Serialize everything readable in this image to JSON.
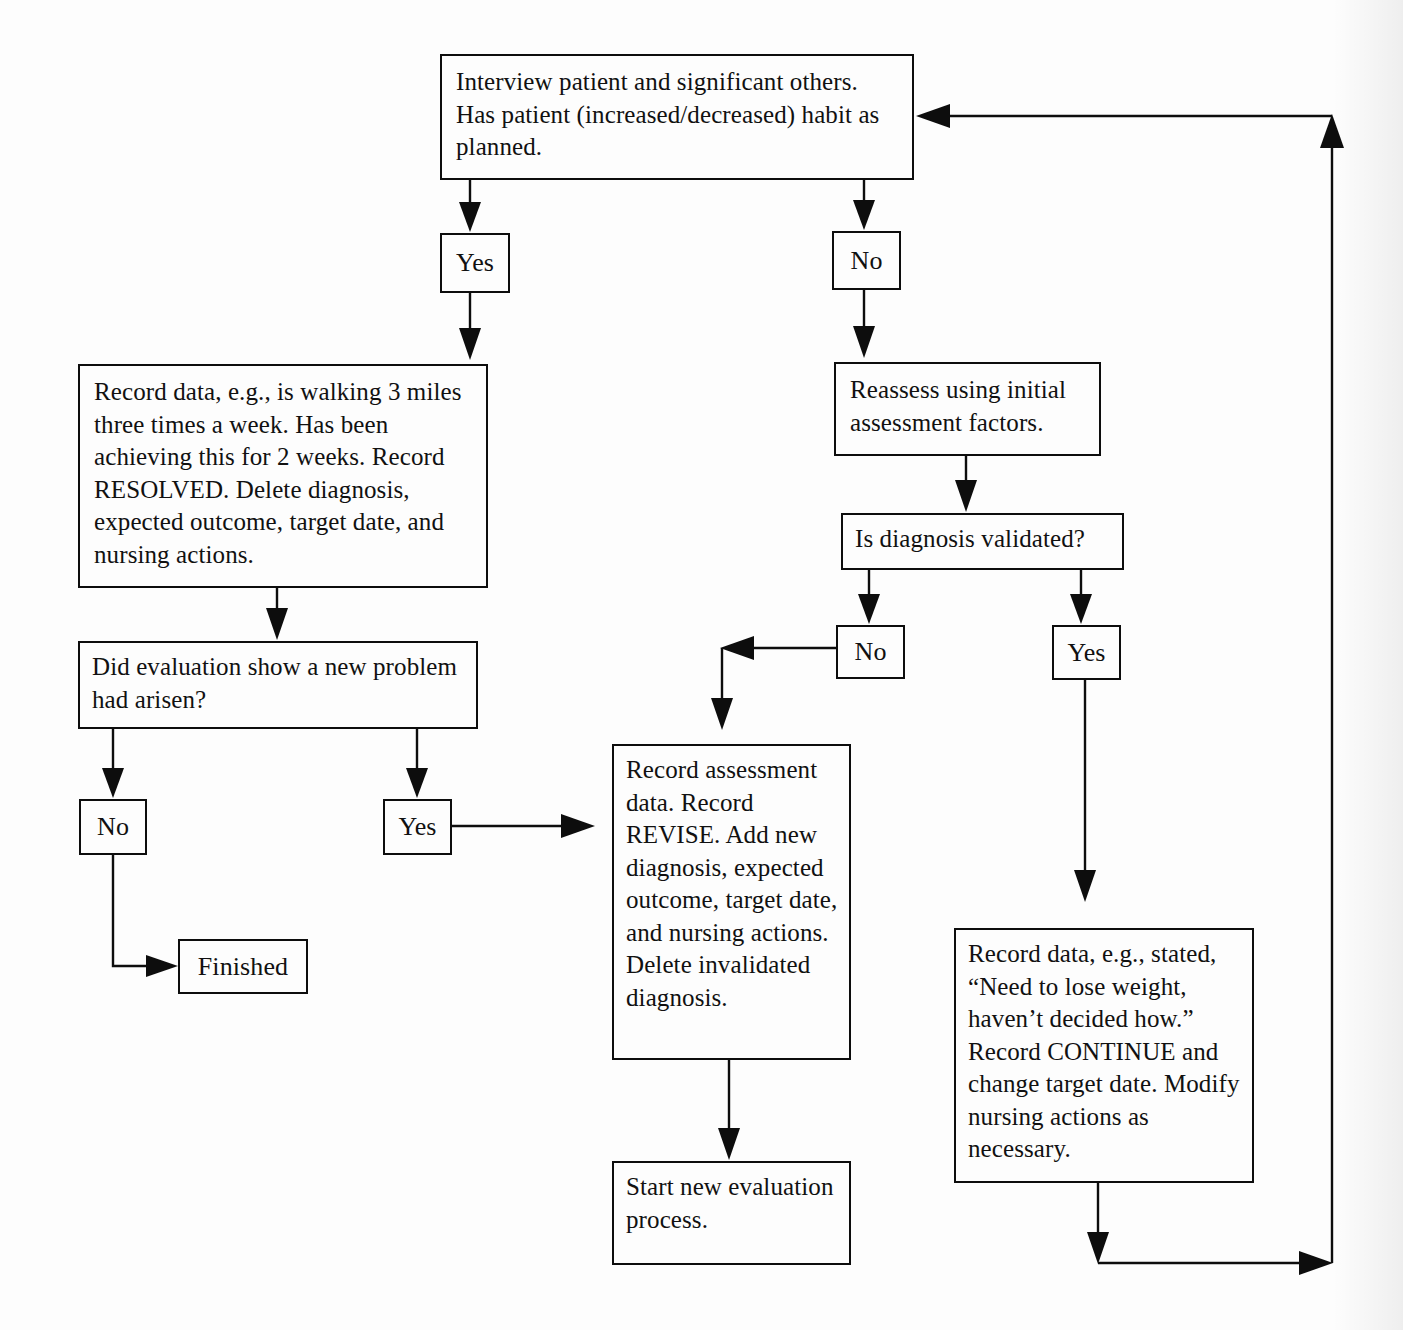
{
  "diagram": {
    "colors": {
      "ink": "#0d0d0d",
      "paper": "#fdfdfd"
    },
    "nodes": {
      "interview": "Interview patient and significant others. Has patient (increased/decreased) habit as planned.",
      "yes_top": "Yes",
      "no_top": "No",
      "record_resolved": "Record data, e.g., is walking 3 miles three times a week. Has been achieving this for 2 weeks. Record RESOLVED. Delete diagnosis, expected outcome, target date, and nursing actions.",
      "reassess": "Reassess using initial assessment factors.",
      "did_evaluation": "Did evaluation show a new problem had arisen?",
      "is_validated": "Is diagnosis validated?",
      "no_validated": "No",
      "yes_validated": "Yes",
      "no_newproblem": "No",
      "yes_newproblem": "Yes",
      "finished": "Finished",
      "record_revise": "Record assessment data. Record REVISE. Add new diagnosis, expected outcome, target date, and nursing actions. Delete invalidated diagnosis.",
      "record_continue": "Record data, e.g., stated, “Need to lose weight, haven’t decided how.” Record CONTINUE and change target date. Modify nursing actions as necessary.",
      "start_new": "Start new evaluation process."
    },
    "edges": [
      {
        "from": "interview",
        "to": "yes_top",
        "label": ""
      },
      {
        "from": "interview",
        "to": "no_top",
        "label": ""
      },
      {
        "from": "yes_top",
        "to": "record_resolved",
        "label": ""
      },
      {
        "from": "no_top",
        "to": "reassess",
        "label": ""
      },
      {
        "from": "record_resolved",
        "to": "did_evaluation",
        "label": ""
      },
      {
        "from": "reassess",
        "to": "is_validated",
        "label": ""
      },
      {
        "from": "did_evaluation",
        "to": "no_newproblem",
        "label": ""
      },
      {
        "from": "did_evaluation",
        "to": "yes_newproblem",
        "label": ""
      },
      {
        "from": "is_validated",
        "to": "no_validated",
        "label": ""
      },
      {
        "from": "is_validated",
        "to": "yes_validated",
        "label": ""
      },
      {
        "from": "no_newproblem",
        "to": "finished",
        "label": ""
      },
      {
        "from": "yes_newproblem",
        "to": "record_revise",
        "label": ""
      },
      {
        "from": "no_validated",
        "to": "record_revise",
        "label": ""
      },
      {
        "from": "yes_validated",
        "to": "record_continue",
        "label": ""
      },
      {
        "from": "record_revise",
        "to": "start_new",
        "label": ""
      },
      {
        "from": "record_continue",
        "to": "interview",
        "label": "feedback loop"
      }
    ]
  }
}
